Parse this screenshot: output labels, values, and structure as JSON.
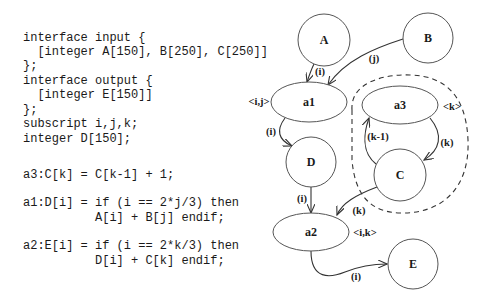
{
  "code": {
    "lines": [
      {
        "text": "interface input {",
        "y": 31
      },
      {
        "text": "  [integer A[150], B[250], C[250]]",
        "y": 45
      },
      {
        "text": "};",
        "y": 59
      },
      {
        "text": "interface output {",
        "y": 74
      },
      {
        "text": "  [integer E[150]]",
        "y": 88
      },
      {
        "text": "};",
        "y": 103
      },
      {
        "text": "subscript i,j,k;",
        "y": 117
      },
      {
        "text": "integer D[150];",
        "y": 132
      },
      {
        "text": "a3:C[k] = C[k-1] + 1;",
        "y": 168
      },
      {
        "text": "a1:D[i] = if (i == 2*j/3) then",
        "y": 196
      },
      {
        "text": "          A[i] + B[j] endif;",
        "y": 211
      },
      {
        "text": "a2:E[i] = if (i == 2*k/3) then",
        "y": 239
      },
      {
        "text": "          D[i] + C[k] endif;",
        "y": 254
      }
    ]
  },
  "graph": {
    "nodes": {
      "A": {
        "label": "A",
        "shape": "circle"
      },
      "B": {
        "label": "B",
        "shape": "circle"
      },
      "a1": {
        "label": "a1",
        "shape": "ellipse",
        "annotation": "<i,j>"
      },
      "D": {
        "label": "D",
        "shape": "circle"
      },
      "a3": {
        "label": "a3",
        "shape": "ellipse",
        "annotation": "<k>"
      },
      "C": {
        "label": "C",
        "shape": "circle"
      },
      "a2": {
        "label": "a2",
        "shape": "ellipse",
        "annotation": "<i,k>"
      },
      "E": {
        "label": "E",
        "shape": "circle"
      }
    },
    "edges": {
      "A_a1": {
        "from": "A",
        "to": "a1",
        "label": "(i)"
      },
      "B_a1": {
        "from": "B",
        "to": "a1",
        "label": "(j)"
      },
      "a1_D": {
        "from": "a1",
        "to": "D",
        "label": "(i)"
      },
      "D_a2": {
        "from": "D",
        "to": "a2",
        "label": "(i)"
      },
      "a3_C": {
        "from": "a3",
        "to": "C",
        "label": "(k)"
      },
      "C_a3": {
        "from": "C",
        "to": "a3",
        "label": "(k-1)"
      },
      "C_a2": {
        "from": "C",
        "to": "a2",
        "label": "(k)"
      },
      "a2_E": {
        "from": "a2",
        "to": "E",
        "label": "(i)"
      }
    }
  }
}
